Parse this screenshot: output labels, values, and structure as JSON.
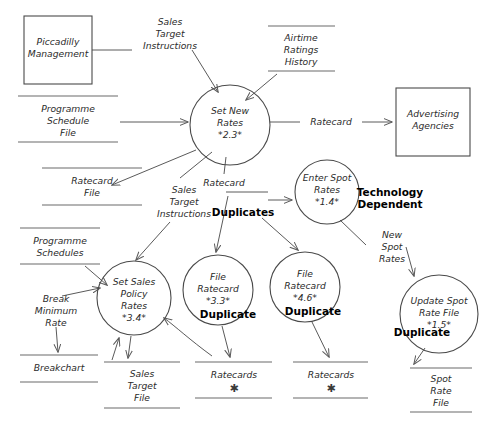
{
  "diagram": {
    "type": "data-flow-diagram",
    "external_entities": [
      {
        "id": "piccadilly-management",
        "lines": [
          "Piccadilly",
          "Management"
        ],
        "x": 24,
        "y": 16,
        "w": 68,
        "h": 68
      },
      {
        "id": "advertising-agencies",
        "lines": [
          "Advertising",
          "Agencies"
        ],
        "x": 396,
        "y": 88,
        "w": 74,
        "h": 68
      }
    ],
    "processes": [
      {
        "id": "set-new-rates",
        "lines": [
          "Set New",
          "Rates",
          "*2.3*"
        ],
        "cx": 230,
        "cy": 125,
        "r": 40,
        "annotation": null
      },
      {
        "id": "enter-spot-rates",
        "lines": [
          "Enter Spot",
          "Rates",
          "*1.4*"
        ],
        "cx": 327,
        "cy": 192,
        "r": 32,
        "annotation": "Technology Dependent",
        "annotation_lines": [
          "Technology",
          "Dependent"
        ],
        "annot_x": 390,
        "annot_y": 192
      },
      {
        "id": "set-sales-policy-rates",
        "lines": [
          "Set Sales",
          "Policy",
          "Rates",
          "*3.4*"
        ],
        "cx": 134,
        "cy": 298,
        "r": 37,
        "annotation": null
      },
      {
        "id": "file-ratecard-33",
        "lines": [
          "File",
          "Ratecard",
          "*3.3*"
        ],
        "cx": 218,
        "cy": 290,
        "r": 35,
        "annotation": "Duplicate",
        "annotation_lines": [
          "Duplicate"
        ],
        "annot_x": 225,
        "annot_y": 313
      },
      {
        "id": "file-ratecard-46",
        "lines": [
          "File",
          "Ratecard",
          "*4.6*"
        ],
        "cx": 305,
        "cy": 287,
        "r": 35,
        "annotation": "Duplicate",
        "annotation_lines": [
          "Duplicate"
        ],
        "annot_x": 312,
        "annot_y": 310
      },
      {
        "id": "update-spot-rate-file",
        "lines": [
          "Update Spot",
          "Rate File",
          "*1.5*"
        ],
        "cx": 439,
        "cy": 314,
        "r": 39,
        "annotation": "Duplicate",
        "annotation_lines": [
          "Duplicate"
        ],
        "annot_x": 423,
        "annot_y": 330
      }
    ],
    "data_stores": [
      {
        "id": "programme-schedule-file",
        "lines": [
          "Programme",
          "Schedule",
          "File"
        ],
        "x1": 18,
        "x2": 118,
        "y_top": 96,
        "y_bot": 142,
        "star": false
      },
      {
        "id": "ratecard-file",
        "lines": [
          "Ratecard",
          "File"
        ],
        "x1": 42,
        "x2": 142,
        "y_top": 168,
        "y_bot": 205,
        "star": false
      },
      {
        "id": "airtime-ratings-history",
        "lines": [
          "Airtime",
          "Ratings",
          "History"
        ],
        "x1": 268,
        "x2": 335,
        "y_top": 26,
        "y_bot": 71,
        "star": false
      },
      {
        "id": "programme-schedules",
        "lines": [
          "Programme",
          "Schedules"
        ],
        "x1": 20,
        "x2": 100,
        "y_top": 228,
        "y_bot": 264,
        "star": false
      },
      {
        "id": "breakchart",
        "lines": [
          "Breakchart"
        ],
        "x1": 20,
        "x2": 98,
        "y_top": 355,
        "y_bot": 382,
        "star": false
      },
      {
        "id": "sales-target-file",
        "lines": [
          "Sales",
          "Target",
          "File"
        ],
        "x1": 104,
        "x2": 180,
        "y_top": 362,
        "y_bot": 408,
        "star": false
      },
      {
        "id": "ratecards-left",
        "lines": [
          "Ratecards"
        ],
        "x1": 195,
        "x2": 272,
        "y_top": 362,
        "y_bot": 398,
        "star": true
      },
      {
        "id": "ratecards-right",
        "lines": [
          "Ratecards"
        ],
        "x1": 293,
        "x2": 368,
        "y_top": 362,
        "y_bot": 398,
        "star": true
      },
      {
        "id": "spot-rate-file",
        "lines": [
          "Spot",
          "Rate",
          "File"
        ],
        "x1": 410,
        "x2": 472,
        "y_top": 368,
        "y_bot": 412,
        "star": false
      }
    ],
    "flow_labels": [
      {
        "id": "sales-target-instructions-top",
        "lines": [
          "Sales",
          "Target",
          "Instructions"
        ],
        "x": 170,
        "y": 30
      },
      {
        "id": "ratecard-to-agencies",
        "lines": [
          "Ratecard"
        ],
        "x": 330,
        "y": 122
      },
      {
        "id": "ratecard-from-set-new-rates",
        "lines": [
          "Ratecard"
        ],
        "x": 224,
        "y": 183
      },
      {
        "id": "sales-target-instructions-mid",
        "lines": [
          "Sales",
          "Target",
          "Instructions"
        ],
        "x": 184,
        "y": 198
      },
      {
        "id": "break-minimum-rate",
        "lines": [
          "Break",
          "Minimum",
          "Rate"
        ],
        "x": 58,
        "y": 305
      },
      {
        "id": "new-spot-rates",
        "lines": [
          "New",
          "Spot",
          "Rates"
        ],
        "x": 392,
        "y": 240
      }
    ],
    "annotations": [
      {
        "id": "duplicates-annotation",
        "text": "Duplicates",
        "x": 243,
        "y": 212
      }
    ]
  }
}
